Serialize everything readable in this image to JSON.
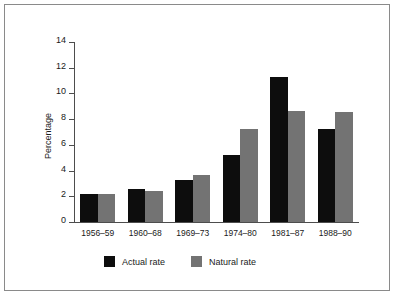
{
  "chart_data": {
    "type": "bar",
    "title": "",
    "xlabel": "",
    "ylabel": "Percentage",
    "ylim": [
      0,
      14
    ],
    "ytick_step": 2,
    "yticks": [
      14,
      12,
      10,
      8,
      6,
      4,
      2,
      0
    ],
    "grid": false,
    "legend_position": "bottom-left",
    "categories": [
      "1956–59",
      "1960–68",
      "1969–73",
      "1974–80",
      "1981–87",
      "1988–90"
    ],
    "series": [
      {
        "name": "Actual rate",
        "color": "#0d0d0d",
        "values": [
          2.2,
          2.6,
          3.3,
          5.25,
          11.25,
          7.25
        ]
      },
      {
        "name": "Natural rate",
        "color": "#737373",
        "values": [
          2.2,
          2.4,
          3.65,
          7.25,
          8.6,
          8.55
        ]
      }
    ]
  },
  "axis": {
    "y_title": "Percentage"
  },
  "legend": {
    "items": [
      {
        "label": "Actual rate"
      },
      {
        "label": "Natural rate"
      }
    ]
  }
}
